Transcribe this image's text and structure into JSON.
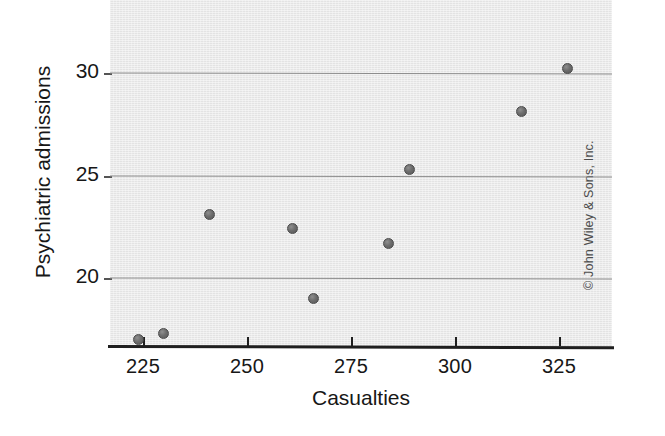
{
  "chart_data": {
    "type": "scatter",
    "title": "",
    "xlabel": "Casualties",
    "ylabel": "Psychiatric admissions",
    "xlim": [
      212,
      332
    ],
    "ylim": [
      16.2,
      33.0
    ],
    "grid": true,
    "legend": null,
    "xticks": [
      225,
      250,
      275,
      300,
      325
    ],
    "yticks": [
      20,
      25,
      30
    ],
    "xticklabels": [
      "225",
      "250",
      "275",
      "300",
      "325"
    ],
    "yticklabels": [
      "20",
      "25",
      "30"
    ],
    "series": [
      {
        "name": "Psychiatric admissions vs casualties",
        "marker": "circle",
        "color": "#6d6d6d",
        "points": [
          {
            "x": 224,
            "y": 17.0
          },
          {
            "x": 230,
            "y": 17.3
          },
          {
            "x": 241,
            "y": 23.1
          },
          {
            "x": 261,
            "y": 22.4
          },
          {
            "x": 266,
            "y": 19.0
          },
          {
            "x": 284,
            "y": 21.7
          },
          {
            "x": 289,
            "y": 25.3
          },
          {
            "x": 316,
            "y": 28.1
          },
          {
            "x": 327,
            "y": 30.2
          }
        ]
      }
    ]
  },
  "figure": {
    "panel_background": "#e9e9e9",
    "gridline_color": "#8d8d8d",
    "axis_color": "#1f1f1f",
    "marker_color": "#6d6d6d"
  },
  "credit": {
    "text": "© John Wiley & Sons, Inc."
  }
}
